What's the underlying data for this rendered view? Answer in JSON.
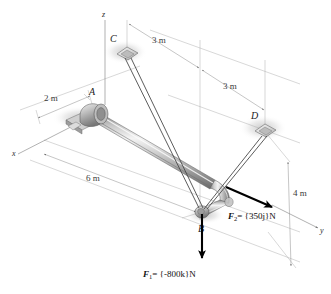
{
  "figure": {
    "background_color": "#ffffff"
  },
  "axes": [
    {
      "id": "z",
      "label": "z",
      "description": "vertical axis upward through A"
    },
    {
      "id": "x",
      "label": "x",
      "description": "axis toward lower left"
    },
    {
      "id": "y",
      "label": "y",
      "description": "axis toward lower right"
    }
  ],
  "points": [
    {
      "id": "A",
      "label": "A",
      "type": "bearing-support",
      "description": "pillow block bearing at pipe end"
    },
    {
      "id": "B",
      "label": "B",
      "type": "pipe-joint",
      "description": "elbow joint where forces are applied"
    },
    {
      "id": "C",
      "label": "C",
      "type": "anchor-plate",
      "description": "diamond anchor plate for cable"
    },
    {
      "id": "D",
      "label": "D",
      "type": "anchor-plate",
      "description": "diamond anchor plate for cable"
    }
  ],
  "dimensions": [
    {
      "id": "dim-2m",
      "label": "2 m",
      "from": "x-axis",
      "to": "A"
    },
    {
      "id": "dim-3m-upper",
      "label": "3 m",
      "from": "C",
      "to": "vertical-reference"
    },
    {
      "id": "dim-3m-lower",
      "label": "3 m",
      "from": "vertical-reference",
      "to": "D"
    },
    {
      "id": "dim-6m",
      "label": "6 m",
      "from": "A",
      "to": "B"
    },
    {
      "id": "dim-4m",
      "label": "4 m",
      "from": "D-level",
      "to": "y-axis"
    }
  ],
  "forces": [
    {
      "id": "F2",
      "symbol": "F",
      "subscript": "2",
      "expression": "= {350j}N",
      "magnitude": 350,
      "direction": "j",
      "full_text": "F2 = {350j}N",
      "applied_at": "B",
      "color": "#000000"
    },
    {
      "id": "F1",
      "symbol": "F",
      "subscript": "1",
      "expression": "= {-800k}N",
      "magnitude": -800,
      "direction": "k",
      "full_text": "F1 = {-800k}N",
      "applied_at": "B",
      "color": "#000000"
    }
  ],
  "cables": [
    {
      "id": "cable-CB",
      "from": "C",
      "to": "B"
    },
    {
      "id": "cable-DB",
      "from": "D",
      "to": "B"
    }
  ],
  "colors": {
    "pipe_light": "#f0f0f0",
    "pipe_mid": "#b9b9b9",
    "pipe_dark": "#6e6e6e",
    "cable": "#4a4a4a",
    "dimension": "#8c8c8c",
    "force": "#000000",
    "shadow": "#cfcfcf"
  }
}
